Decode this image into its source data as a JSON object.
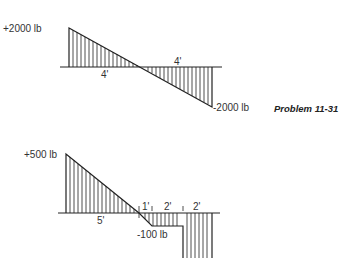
{
  "figure": {
    "problem_label": "Problem 11-31",
    "top_diagram": {
      "max_label": "+2000 lb",
      "min_label": "-2000 lb",
      "segment_labels": [
        "4'",
        "4'"
      ]
    },
    "bottom_diagram": {
      "max_label": "+500 lb",
      "min_label": "-100 lb",
      "segment_labels": [
        "5'",
        "1'",
        "2'",
        "2'"
      ]
    }
  }
}
